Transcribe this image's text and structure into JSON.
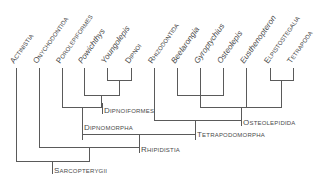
{
  "diagram": {
    "type": "cladogram",
    "taxa": [
      {
        "name": "Actinistia",
        "style": "smallcaps",
        "x": 16
      },
      {
        "name": "Onychodontida",
        "style": "smallcaps",
        "x": 39
      },
      {
        "name": "Porolepiformes",
        "style": "smallcaps",
        "x": 62
      },
      {
        "name": "Powichthys",
        "style": "italic",
        "x": 84
      },
      {
        "name": "Youngolepis",
        "style": "italic",
        "x": 107
      },
      {
        "name": "Dipnoi",
        "style": "smallcaps",
        "x": 131
      },
      {
        "name": "Rhizodontida",
        "style": "smallcaps",
        "x": 154
      },
      {
        "name": "Beelarongia",
        "style": "italic",
        "x": 177
      },
      {
        "name": "Gyroptychius",
        "style": "italic",
        "x": 200
      },
      {
        "name": "Osteolepis",
        "style": "italic",
        "x": 223
      },
      {
        "name": "Eusthenopteron",
        "style": "italic",
        "x": 246
      },
      {
        "name": "Elpistostegalia",
        "style": "smallcaps",
        "x": 270
      },
      {
        "name": "Tetrapoda",
        "style": "smallcaps",
        "x": 293
      }
    ],
    "clades": [
      {
        "name": "Dipnoiformes"
      },
      {
        "name": "Dipnomorpha"
      },
      {
        "name": "Osteolepidida"
      },
      {
        "name": "Tetrapodomorpha"
      },
      {
        "name": "Rhipidistia"
      },
      {
        "name": "Sarcopterygii"
      }
    ],
    "line_color": "#5a5a5a",
    "text_color": "#4a4a4a"
  }
}
